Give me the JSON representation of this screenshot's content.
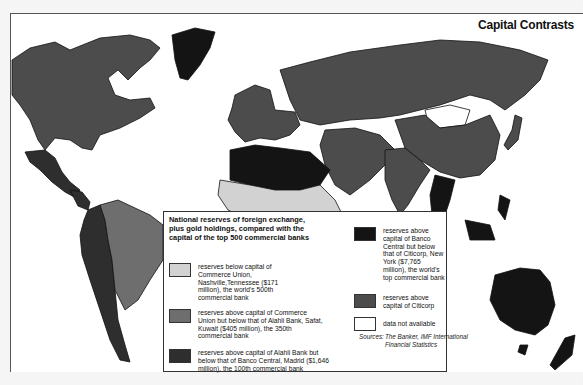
{
  "title": "Capital Contrasts",
  "legend": {
    "heading": "National reserves of foreign exchange, plus gold holdings, compared with the capital of the top 500 commercial banks",
    "items": [
      {
        "id": "tier1",
        "color": "#d2d2d2",
        "label": "reserves below capital of Commerce Union, Nashville,Tennessee ($171 million), the world's 500th commercial bank"
      },
      {
        "id": "tier2",
        "color": "#6e6e6e",
        "label": "reserves above capital of Commerce Union but below that of Alahli Bank, Safat, Kuwait ($405 million), the 350th commercial bank"
      },
      {
        "id": "tier3",
        "color": "#2e2e2e",
        "label": "reserves above capital of Alahli Bank but below that of Banco Central, Madrid ($1,646 million), the 100th commercial bank"
      },
      {
        "id": "tier4",
        "color": "#141414",
        "label": "reserves above capital of Banco Central but below that of Citicorp, New York ($7,765 million), the world's top commercial bank"
      },
      {
        "id": "tier5",
        "color": "#4c4c4c",
        "label": "reserves above capital of Citicorp"
      },
      {
        "id": "na",
        "color": "#ffffff",
        "label": "data not available"
      }
    ],
    "sources_label": "Sources:",
    "sources_text": "The Banker, IMF International Financial Statistics"
  },
  "regions": [
    {
      "name": "canada-usa",
      "tier": "tier5"
    },
    {
      "name": "greenland",
      "tier": "tier4"
    },
    {
      "name": "mexico",
      "tier": "tier3"
    },
    {
      "name": "central-america",
      "tier": "tier3"
    },
    {
      "name": "south-america-brazil",
      "tier": "tier2"
    },
    {
      "name": "south-america-west",
      "tier": "tier3"
    },
    {
      "name": "europe",
      "tier": "tier5"
    },
    {
      "name": "ussr",
      "tier": "tier5"
    },
    {
      "name": "china",
      "tier": "tier5"
    },
    {
      "name": "mongolia",
      "tier": "na"
    },
    {
      "name": "north-africa",
      "tier": "tier4"
    },
    {
      "name": "sub-saharan-africa",
      "tier": "tier1"
    },
    {
      "name": "southern-africa",
      "tier": "tier3"
    },
    {
      "name": "middle-east",
      "tier": "tier5"
    },
    {
      "name": "india",
      "tier": "tier5"
    },
    {
      "name": "southeast-asia",
      "tier": "tier4"
    },
    {
      "name": "australia",
      "tier": "tier4"
    },
    {
      "name": "japan",
      "tier": "tier5"
    }
  ]
}
